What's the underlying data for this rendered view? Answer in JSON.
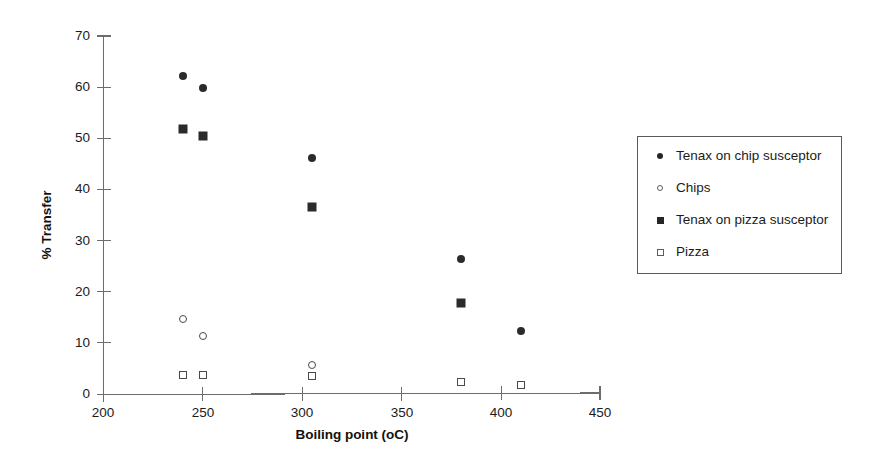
{
  "chart_data": {
    "type": "scatter",
    "title": "",
    "xlabel": "Boiling point (oC)",
    "ylabel": "% Transfer",
    "xlim": [
      200,
      450
    ],
    "ylim": [
      0,
      70
    ],
    "xticks": [
      200,
      250,
      300,
      350,
      400,
      450
    ],
    "yticks": [
      0,
      10,
      20,
      30,
      40,
      50,
      60,
      70
    ],
    "grid": false,
    "legend_position": "right",
    "series": [
      {
        "name": "Tenax on chip susceptor",
        "marker": "filled-circle",
        "color": "#2b2b2b",
        "points": [
          {
            "x": 240,
            "y": 62.2
          },
          {
            "x": 250,
            "y": 59.8
          },
          {
            "x": 305,
            "y": 46.1
          },
          {
            "x": 380,
            "y": 26.5
          },
          {
            "x": 410,
            "y": 12.3
          }
        ]
      },
      {
        "name": "Chips",
        "marker": "open-circle",
        "color": "#4a4a4a",
        "points": [
          {
            "x": 240,
            "y": 14.7
          },
          {
            "x": 250,
            "y": 11.3
          },
          {
            "x": 305,
            "y": 5.8
          }
        ]
      },
      {
        "name": "Tenax on pizza susceptor",
        "marker": "filled-square",
        "color": "#2b2b2b",
        "points": [
          {
            "x": 240,
            "y": 51.8
          },
          {
            "x": 250,
            "y": 50.4
          },
          {
            "x": 305,
            "y": 36.5
          },
          {
            "x": 380,
            "y": 17.9
          }
        ]
      },
      {
        "name": "Pizza",
        "marker": "open-square",
        "color": "#4a4a4a",
        "points": [
          {
            "x": 240,
            "y": 3.8
          },
          {
            "x": 250,
            "y": 3.8
          },
          {
            "x": 305,
            "y": 3.6
          },
          {
            "x": 380,
            "y": 2.4
          },
          {
            "x": 410,
            "y": 1.8
          }
        ]
      }
    ]
  },
  "legend": {
    "entries": [
      {
        "label": "Tenax on chip susceptor",
        "marker": "filled-circle"
      },
      {
        "label": "Chips",
        "marker": "open-circle"
      },
      {
        "label": "Tenax on pizza susceptor",
        "marker": "filled-square"
      },
      {
        "label": "Pizza",
        "marker": "open-square"
      }
    ]
  }
}
